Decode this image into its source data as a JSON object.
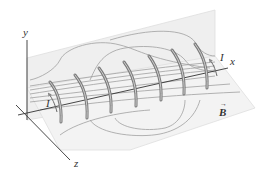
{
  "figure": {
    "axes": {
      "x_label": "x",
      "y_label": "y",
      "z_label": "z"
    },
    "current_label_left": "I",
    "current_label_right": "I",
    "field_label": "B",
    "field_vector_arrow": "→",
    "coil_count": 7,
    "colors": {
      "plane_fill": "#ececec",
      "plane_edge": "#d8d8d8",
      "coil": "#7a7a7a",
      "coil_highlight": "#cfcfcf",
      "field_line": "#9a9a9a",
      "axis": "#333333"
    }
  }
}
